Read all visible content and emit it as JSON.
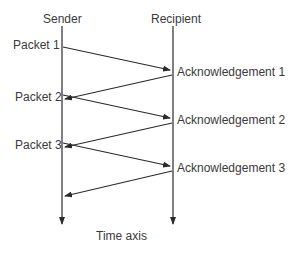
{
  "diagram": {
    "type": "sequence",
    "lanes": {
      "sender": "Sender",
      "recipient": "Recipient"
    },
    "packets": [
      {
        "label": "Packet 1"
      },
      {
        "label": "Packet 2"
      },
      {
        "label": "Packet 3"
      }
    ],
    "acknowledgements": [
      {
        "label": "Acknowledgement 1"
      },
      {
        "label": "Acknowledgement 2"
      },
      {
        "label": "Acknowledgement 3"
      }
    ],
    "axis_label": "Time axis",
    "line_color": "#2a2a2a",
    "text_color": "#3a3a3a"
  }
}
